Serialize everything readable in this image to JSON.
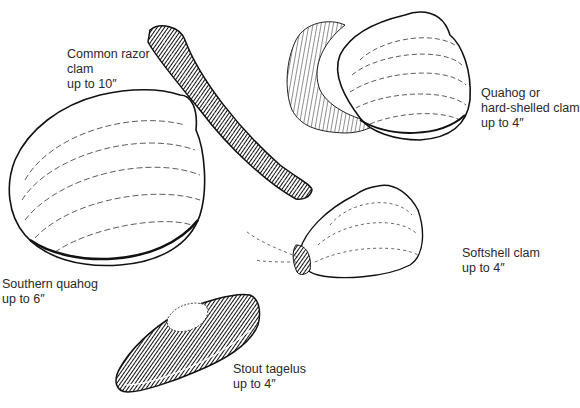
{
  "figure": {
    "colors": {
      "ink": "#1a1a1a",
      "paper": "#ffffff",
      "text": "#2a2a2a"
    }
  },
  "specimens": [
    {
      "id": "common-razor-clam",
      "name_lines": [
        "Common razor",
        "clam"
      ],
      "size": "up to 10″"
    },
    {
      "id": "quahog",
      "name_lines": [
        "Quahog or",
        "hard-shelled clam"
      ],
      "size": "up to 4″"
    },
    {
      "id": "southern-quahog",
      "name_lines": [
        "Southern quahog"
      ],
      "size": "up to 6″"
    },
    {
      "id": "softshell-clam",
      "name_lines": [
        "Softshell clam"
      ],
      "size": "up to 4″"
    },
    {
      "id": "stout-tagelus",
      "name_lines": [
        "Stout tagelus"
      ],
      "size": "up to 4″"
    }
  ]
}
